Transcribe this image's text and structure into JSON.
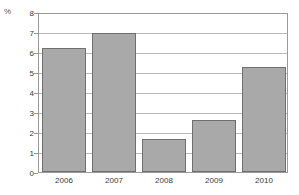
{
  "chart_data": {
    "type": "bar",
    "title": "",
    "subtitle": "",
    "xlabel": "",
    "ylabel": "%",
    "unit_label": "%",
    "categories": [
      "2006",
      "2007",
      "2008",
      "2009",
      "2010"
    ],
    "values": [
      6.3,
      7.05,
      1.65,
      2.65,
      5.3
    ],
    "series": [
      {
        "name": "",
        "values": [
          6.3,
          7.05,
          1.65,
          2.65,
          5.3
        ]
      }
    ],
    "ylim": [
      0,
      8
    ],
    "ytick_step": 1,
    "yticks": [
      "8",
      "7",
      "6",
      "5",
      "4",
      "3",
      "2",
      "1",
      "0"
    ],
    "ytick_values": [
      8,
      7,
      6,
      5,
      4,
      3,
      2,
      1,
      0
    ],
    "grid": true,
    "grid_axis": "y",
    "legend": false,
    "legend_position": "none",
    "bar_fill_color": "#a9a9a9",
    "bar_border_color": "#6f6f6f",
    "gridline_color": "#b9b9b9",
    "frame_color": "#9a9a9a",
    "background_color": "#ffffff",
    "text_color": "#3a3a3a"
  }
}
